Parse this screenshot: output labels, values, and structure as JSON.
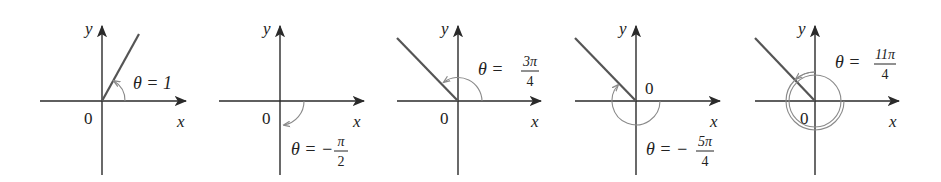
{
  "figure": {
    "panels": [
      {
        "id": 1,
        "theta_label": "θ = 1",
        "theta_num": "",
        "theta_den": "",
        "origin_label": "0",
        "x_label": "x",
        "y_label": "y",
        "angle_radians": "1"
      },
      {
        "id": 2,
        "theta_label": "θ = −",
        "theta_num": "π",
        "theta_den": "2",
        "origin_label": "0",
        "x_label": "x",
        "y_label": "y",
        "angle_radians": "-π/2"
      },
      {
        "id": 3,
        "theta_label": "θ =",
        "theta_num": "3π",
        "theta_den": "4",
        "origin_label": "0",
        "x_label": "x",
        "y_label": "y",
        "angle_radians": "3π/4"
      },
      {
        "id": 4,
        "theta_label": "θ = −",
        "theta_num": "5π",
        "theta_den": "4",
        "origin_label": "0",
        "x_label": "x",
        "y_label": "y",
        "angle_radians": "-5π/4"
      },
      {
        "id": 5,
        "theta_label": "θ =",
        "theta_num": "11π",
        "theta_den": "4",
        "origin_label": "0",
        "x_label": "x",
        "y_label": "y",
        "angle_radians": "11π/4"
      }
    ],
    "colors": {
      "axis": "#2a2a2a",
      "ray": "#555555",
      "arc": "#8a8a8a",
      "text": "#222222"
    }
  }
}
